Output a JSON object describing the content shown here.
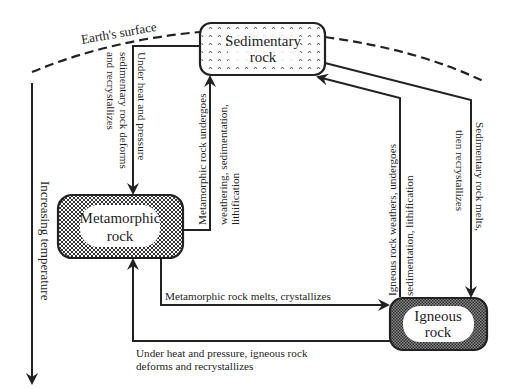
{
  "diagram": {
    "surface_label": "Earth's surface",
    "axis_label": "Increasing temperature",
    "nodes": {
      "sedimentary": {
        "line1": "Sedimentary",
        "line2": "rock",
        "pattern": "sparse-chevrons"
      },
      "metamorphic": {
        "line1": "Metamorphic",
        "line2": "rock",
        "pattern": "crosshatch"
      },
      "igneous": {
        "line1": "Igneous",
        "line2": "rock",
        "pattern": "dense-dots"
      }
    },
    "edges": {
      "sed_to_meta": {
        "from": "sedimentary",
        "to": "metamorphic",
        "line1": "Under heat and pressure",
        "line2": "sedimentary rock deforms",
        "line3": "and recrystallizes"
      },
      "meta_to_sed": {
        "from": "metamorphic",
        "to": "sedimentary",
        "line1": "Metamorphic rock undergoes",
        "line2": "weathering, sedimentation,",
        "line3": "lithification"
      },
      "ign_to_sed": {
        "from": "igneous",
        "to": "sedimentary",
        "line1": "Igneous rock weathers, undergoes",
        "line2": "sedimentation, lithification"
      },
      "sed_to_ign": {
        "from": "sedimentary",
        "to": "igneous",
        "line1": "Sedimentary rock melts,",
        "line2": "then recrystallizes"
      },
      "meta_to_ign": {
        "from": "metamorphic",
        "to": "igneous",
        "line1": "Metamorphic rock melts, crystallizes"
      },
      "ign_to_meta": {
        "from": "igneous",
        "to": "metamorphic",
        "line1": "Under heat and pressure, igneous rock",
        "line2": "deforms and recrystallizes"
      }
    },
    "colors": {
      "stroke": "#222222",
      "background": "#ffffff",
      "igneous_fill": "#555555",
      "metamorphic_fill": "#777777"
    }
  }
}
